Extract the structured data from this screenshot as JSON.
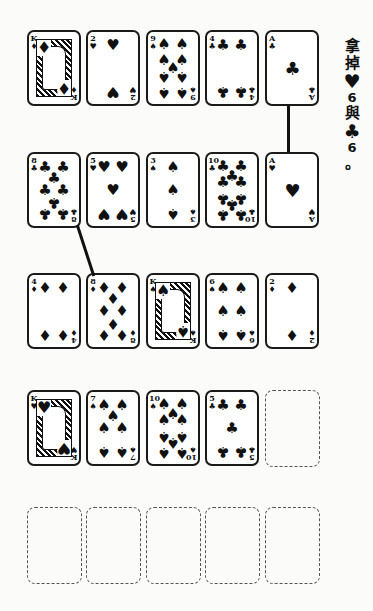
{
  "note": {
    "lines": [
      "拿",
      "掉",
      "♥",
      "6",
      "與",
      "♣",
      "6",
      "。"
    ]
  },
  "rows": [
    [
      {
        "rank": "K",
        "suit": "♦",
        "type": "face"
      },
      {
        "rank": "2",
        "suit": "♥",
        "type": "pips"
      },
      {
        "rank": "9",
        "suit": "♠",
        "type": "pips"
      },
      {
        "rank": "4",
        "suit": "♣",
        "type": "pips"
      },
      {
        "rank": "A",
        "suit": "♣",
        "type": "pips"
      }
    ],
    [
      {
        "rank": "8",
        "suit": "♣",
        "type": "pips"
      },
      {
        "rank": "5",
        "suit": "♥",
        "type": "pips"
      },
      {
        "rank": "3",
        "suit": "♠",
        "type": "pips"
      },
      {
        "rank": "10",
        "suit": "♣",
        "type": "pips"
      },
      {
        "rank": "A",
        "suit": "♥",
        "type": "pips"
      }
    ],
    [
      {
        "rank": "4",
        "suit": "♦",
        "type": "pips"
      },
      {
        "rank": "8",
        "suit": "♦",
        "type": "pips"
      },
      {
        "rank": "K",
        "suit": "♠",
        "type": "face"
      },
      {
        "rank": "6",
        "suit": "♠",
        "type": "pips"
      },
      {
        "rank": "2",
        "suit": "♦",
        "type": "pips"
      }
    ],
    [
      {
        "rank": "K",
        "suit": "♥",
        "type": "face"
      },
      {
        "rank": "7",
        "suit": "♠",
        "type": "pips"
      },
      {
        "rank": "10",
        "suit": "♠",
        "type": "pips"
      },
      {
        "rank": "5",
        "suit": "♣",
        "type": "pips"
      },
      {
        "rank": "",
        "suit": "",
        "type": "empty"
      }
    ],
    [
      {
        "rank": "",
        "suit": "",
        "type": "empty"
      },
      {
        "rank": "",
        "suit": "",
        "type": "empty"
      },
      {
        "rank": "",
        "suit": "",
        "type": "empty"
      },
      {
        "rank": "",
        "suit": "",
        "type": "empty"
      },
      {
        "rank": "",
        "suit": "",
        "type": "empty"
      }
    ]
  ],
  "connectors": [
    {
      "from": "row1-card5",
      "to": "row2-card5"
    },
    {
      "from": "row2-card1",
      "to": "row3-card2"
    }
  ],
  "colors": {
    "ink": "#111111",
    "paper": "#fbfbf9",
    "slot_border": "#555555"
  }
}
